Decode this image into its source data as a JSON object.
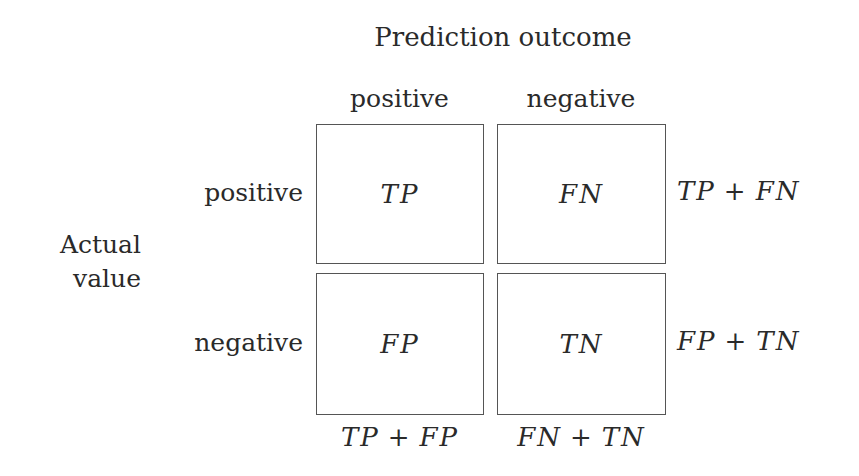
{
  "title": "Prediction outcome",
  "column_headers": [
    "positive",
    "negative"
  ],
  "axis_label_left": [
    "Actual",
    "value"
  ],
  "row_headers": [
    "positive",
    "negative"
  ],
  "cells": [
    [
      "TP",
      "FN"
    ],
    [
      "FP",
      "TN"
    ]
  ],
  "row_sums": [
    {
      "a": "TP",
      "op": "+",
      "b": "FN"
    },
    {
      "a": "FP",
      "op": "+",
      "b": "TN"
    }
  ],
  "column_sums": [
    {
      "a": "TP",
      "op": "+",
      "b": "FP"
    },
    {
      "a": "FN",
      "op": "+",
      "b": "TN"
    }
  ],
  "style": {
    "border_color": "#555555",
    "text_color": "#2a2a2a",
    "background": "#ffffff"
  }
}
